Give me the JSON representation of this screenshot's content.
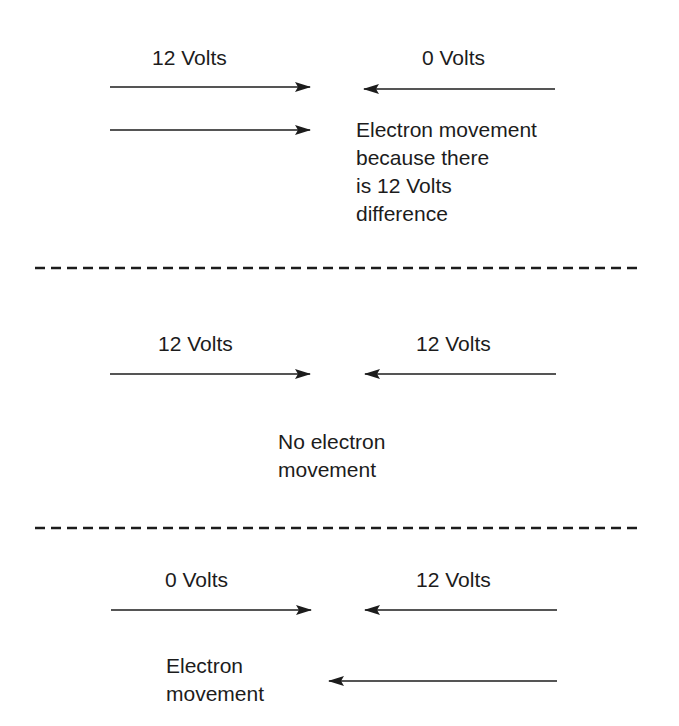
{
  "diagram": {
    "colors": {
      "ink": "#1c1c1c",
      "background": "#ffffff"
    },
    "sections": [
      {
        "id": "section-1",
        "left_label": "12 Volts",
        "right_label": "0 Volts",
        "caption_lines": [
          "Electron movement",
          "because there",
          "is 12 Volts",
          "difference"
        ],
        "movement_arrow_direction": "right"
      },
      {
        "id": "section-2",
        "left_label": "12 Volts",
        "right_label": "12 Volts",
        "caption_lines": [
          "No electron",
          "movement"
        ],
        "movement_arrow_direction": "none"
      },
      {
        "id": "section-3",
        "left_label": "0 Volts",
        "right_label": "12 Volts",
        "caption_lines": [
          "Electron",
          "movement"
        ],
        "movement_arrow_direction": "left"
      }
    ],
    "dividers": 2
  }
}
